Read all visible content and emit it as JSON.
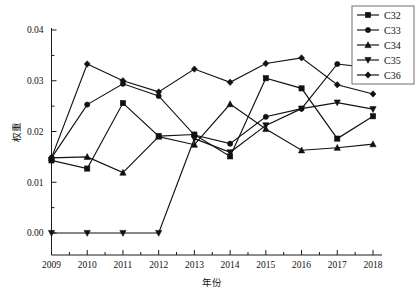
{
  "chart_data": {
    "type": "line",
    "title": "",
    "xlabel": "年份",
    "ylabel": "权重",
    "categories": [
      "2009",
      "2010",
      "2011",
      "2012",
      "2013",
      "2014",
      "2015",
      "2016",
      "2017",
      "2018"
    ],
    "x": [
      2009,
      2010,
      2011,
      2012,
      2013,
      2014,
      2015,
      2016,
      2017,
      2018
    ],
    "xlim": [
      2009,
      2018
    ],
    "ylim": [
      0.0,
      0.04
    ],
    "ytick_labels": [
      "0.00",
      "0.01",
      "0.02",
      "0.03",
      "0.04"
    ],
    "ytick_values": [
      0.0,
      0.01,
      0.02,
      0.03,
      0.04
    ],
    "grid": false,
    "legend_position": "top-right",
    "series": [
      {
        "name": "C32",
        "marker": "square",
        "values": [
          0.0143,
          0.0127,
          0.0256,
          0.0191,
          0.0194,
          0.0151,
          0.0305,
          0.0285,
          0.0186,
          0.023
        ]
      },
      {
        "name": "C33",
        "marker": "circle",
        "values": [
          0.0148,
          0.0253,
          0.0294,
          0.027,
          0.0193,
          0.0176,
          0.0229,
          0.0245,
          0.0333,
          0.0325
        ]
      },
      {
        "name": "C34",
        "marker": "triangle-up",
        "values": [
          0.0148,
          0.015,
          0.0119,
          0.019,
          0.0174,
          0.0254,
          0.0205,
          0.0163,
          0.0168,
          0.0175
        ]
      },
      {
        "name": "C35",
        "marker": "triangle-down",
        "values": [
          0.0,
          0.0,
          0.0,
          0.0,
          0.0186,
          0.0159,
          0.0212,
          0.0245,
          0.0257,
          0.0244
        ]
      },
      {
        "name": "C36",
        "marker": "diamond",
        "values": [
          0.0148,
          0.0333,
          0.03,
          0.0278,
          0.0323,
          0.0297,
          0.0334,
          0.0345,
          0.0292,
          0.0274
        ]
      }
    ]
  }
}
